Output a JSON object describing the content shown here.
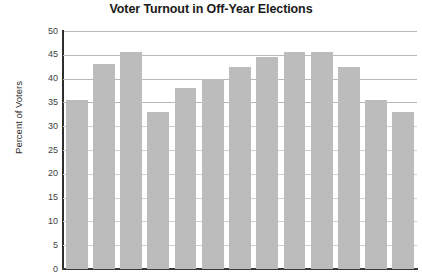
{
  "chart_data": {
    "type": "bar",
    "title": "Voter Turnout in Off-Year Elections",
    "xlabel": "",
    "ylabel": "Percent of Voters",
    "ylim": [
      0,
      50
    ],
    "ytick_step": 5,
    "ytick_labels": [
      "50",
      "45",
      "40",
      "35",
      "30",
      "25",
      "20",
      "15",
      "10",
      "5",
      "0"
    ],
    "grid": true,
    "legend": "none",
    "bar_color": "#bcbcbc",
    "categories": [
      "1",
      "2",
      "3",
      "4",
      "5",
      "6",
      "7",
      "8",
      "9",
      "10",
      "11",
      "12",
      "13"
    ],
    "values": [
      35.5,
      43,
      45.5,
      33,
      38,
      40,
      42.5,
      44.5,
      45.5,
      45.5,
      42.5,
      35.5,
      33
    ]
  }
}
